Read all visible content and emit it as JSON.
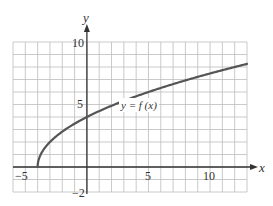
{
  "chart_data": {
    "type": "line",
    "title": "",
    "xlabel": "x",
    "ylabel": "y",
    "xlim": [
      -6,
      13
    ],
    "ylim": [
      -2,
      10
    ],
    "grid": true,
    "grid_step": 1,
    "x_ticks_labeled": [
      -5,
      5,
      10
    ],
    "y_ticks_labeled": [
      -2,
      5,
      10
    ],
    "tick_labels": {
      "x_neg5": "−5",
      "x_5": "5",
      "x_10": "10",
      "y_neg2": "−2",
      "y_5": "5",
      "y_10": "10"
    },
    "series": [
      {
        "name": "y = f(x)",
        "label": "y = f (x)",
        "color": "#555555",
        "formula_estimate": "f(x) = 2*sqrt(x+4)",
        "x": [
          -4,
          -3,
          -2,
          -1,
          0,
          1,
          2,
          4,
          6,
          8,
          10,
          12,
          13
        ],
        "y": [
          0,
          2,
          2.83,
          3.46,
          4,
          4.47,
          4.9,
          5.66,
          6.32,
          6.93,
          7.48,
          8,
          8.25
        ]
      }
    ],
    "annotations": [
      {
        "text": "y = f (x)",
        "x": 4.5,
        "y": 4.8
      }
    ],
    "legend": "none"
  },
  "colors": {
    "grid": "#bdbdbd",
    "axis": "#333333",
    "curve": "#5a5a5a",
    "background": "#ffffff"
  }
}
